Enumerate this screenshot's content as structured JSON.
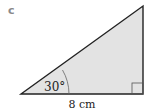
{
  "part_label": "c",
  "triangle": {
    "angle_label": "30°",
    "base_label": "8 cm",
    "fill_color": "#e3e3e3",
    "stroke_color": "#222222",
    "right_angle": true
  }
}
